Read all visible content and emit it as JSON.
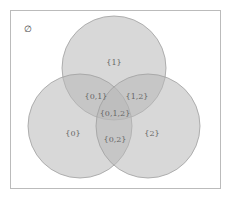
{
  "diagram": {
    "type": "venn",
    "universe_label": "∅",
    "sets": [
      {
        "id": "1",
        "position": "top"
      },
      {
        "id": "0",
        "position": "bottom-left"
      },
      {
        "id": "2",
        "position": "bottom-right"
      }
    ],
    "regions": [
      {
        "id": "only-1",
        "label": "{1}"
      },
      {
        "id": "only-0",
        "label": "{0}"
      },
      {
        "id": "only-2",
        "label": "{2}"
      },
      {
        "id": "0-1",
        "label": "{0,1}"
      },
      {
        "id": "1-2",
        "label": "{1,2}"
      },
      {
        "id": "0-2",
        "label": "{0,2}"
      },
      {
        "id": "0-1-2",
        "label": "{0,1,2}"
      }
    ],
    "colors": {
      "circle_fill": "#b8b8b8",
      "circle_stroke": "#9a9a9a",
      "frame": "#bbbbbb",
      "label": "#666666"
    }
  }
}
